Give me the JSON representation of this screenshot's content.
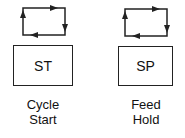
{
  "buttons": [
    {
      "code": "ST",
      "label_line1": "Cycle",
      "label_line2": "Start",
      "icon": "cycle-loop-icon"
    },
    {
      "code": "SP",
      "label_line1": "Feed",
      "label_line2": "Hold",
      "icon": "cycle-loop-icon"
    }
  ]
}
